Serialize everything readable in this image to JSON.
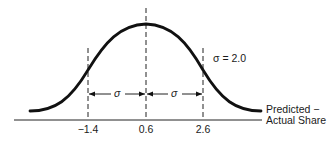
{
  "diagram": {
    "title": "",
    "curve": "normal distribution",
    "mean": "0.6",
    "sigma_label": "σ = 2.0",
    "sigma_symbol": "σ",
    "ticks": [
      "−1.4",
      "0.6",
      "2.6"
    ],
    "axis_label_line1": "Predicted −",
    "axis_label_line2": "Actual Share",
    "colors": {
      "ink": "#111111",
      "background": "#ffffff"
    }
  }
}
